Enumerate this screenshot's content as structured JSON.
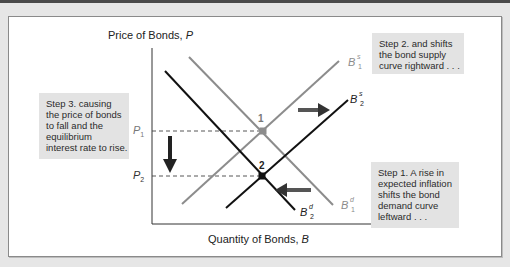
{
  "figure": {
    "y_axis_label": "Price of Bonds, ",
    "y_axis_var": "P",
    "x_axis_label": "Quantity of Bonds, ",
    "x_axis_var": "B",
    "ticks": {
      "p1": {
        "letter": "P",
        "sub": "1"
      },
      "p2": {
        "letter": "P",
        "sub": "2"
      }
    },
    "curves": {
      "supply_1": {
        "letter": "B",
        "sup": "s",
        "sub": "1",
        "color": "#8c8c8c"
      },
      "supply_2": {
        "letter": "B",
        "sup": "s",
        "sub": "2",
        "color": "#111111"
      },
      "demand_1": {
        "letter": "B",
        "sup": "d",
        "sub": "1",
        "color": "#8c8c8c"
      },
      "demand_2": {
        "letter": "B",
        "sup": "d",
        "sub": "2",
        "color": "#111111"
      }
    },
    "points": {
      "eq1": "1",
      "eq2": "2"
    },
    "notes": {
      "step1": [
        "Step 1. A rise in",
        "expected inflation",
        "shifts the bond",
        "demand curve",
        "leftward . . ."
      ],
      "step2": [
        "Step 2. and shifts",
        "the bond supply",
        "curve rightward . . ."
      ],
      "step3": [
        "Step 3. causing",
        "the price of bonds",
        "to fall and the",
        "equilibrium",
        "interest rate to rise."
      ]
    },
    "arrows": {
      "supply_shift": "right",
      "demand_shift": "left",
      "price_change": "down"
    }
  }
}
